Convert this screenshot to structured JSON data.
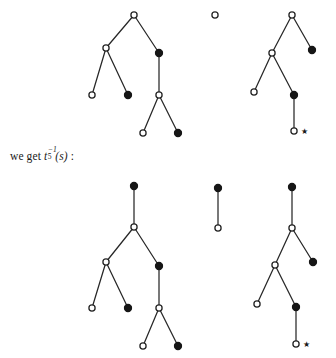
{
  "figure": {
    "caption": {
      "prefix": "we get ",
      "symbol_base": "t",
      "symbol_sub": "5",
      "symbol_sup": "−1",
      "symbol_arg": "(s)",
      "suffix": " :"
    },
    "legend": {
      "open_node": "open-circle-vertex",
      "filled_node": "filled-circle-vertex",
      "star": "★"
    },
    "colors": {
      "ink": "#1a1a1a",
      "edge": "#272727",
      "node_fill_open": "#ffffff",
      "node_fill_closed": "#161616",
      "background": "#ffffff"
    },
    "geometry": {
      "node_radius_open": 3.1,
      "node_radius_filled": 3.6,
      "star_glyph": "★"
    },
    "rows": [
      {
        "name": "top-row",
        "trees": [
          {
            "name": "top-left-tree",
            "nodes": [
              {
                "id": "tl-n1",
                "type": "open",
                "x": 134,
                "y": 15
              },
              {
                "id": "tl-n2",
                "type": "open",
                "x": 106,
                "y": 48
              },
              {
                "id": "tl-n3",
                "type": "filled",
                "x": 159,
                "y": 53
              },
              {
                "id": "tl-n4",
                "type": "open",
                "x": 92,
                "y": 95
              },
              {
                "id": "tl-n5",
                "type": "filled",
                "x": 128,
                "y": 95
              },
              {
                "id": "tl-n6",
                "type": "open",
                "x": 159,
                "y": 95
              },
              {
                "id": "tl-n7",
                "type": "open",
                "x": 143,
                "y": 133
              },
              {
                "id": "tl-n8",
                "type": "filled",
                "x": 178,
                "y": 133
              }
            ],
            "edges": [
              [
                "tl-n1",
                "tl-n2"
              ],
              [
                "tl-n1",
                "tl-n3"
              ],
              [
                "tl-n2",
                "tl-n4"
              ],
              [
                "tl-n2",
                "tl-n5"
              ],
              [
                "tl-n3",
                "tl-n6"
              ],
              [
                "tl-n6",
                "tl-n7"
              ],
              [
                "tl-n6",
                "tl-n8"
              ]
            ],
            "marks": []
          },
          {
            "name": "top-middle-single-node",
            "nodes": [
              {
                "id": "tm-n1",
                "type": "open",
                "x": 215,
                "y": 15
              }
            ],
            "edges": [],
            "marks": []
          },
          {
            "name": "top-right-tree",
            "nodes": [
              {
                "id": "tr-n1",
                "type": "open",
                "x": 292,
                "y": 15
              },
              {
                "id": "tr-n2",
                "type": "open",
                "x": 272,
                "y": 53
              },
              {
                "id": "tr-n3",
                "type": "filled",
                "x": 312,
                "y": 50
              },
              {
                "id": "tr-n4",
                "type": "open",
                "x": 254,
                "y": 92
              },
              {
                "id": "tr-n5",
                "type": "filled",
                "x": 294,
                "y": 95
              },
              {
                "id": "tr-n6",
                "type": "open",
                "x": 294,
                "y": 131
              }
            ],
            "edges": [
              [
                "tr-n1",
                "tr-n2"
              ],
              [
                "tr-n1",
                "tr-n3"
              ],
              [
                "tr-n2",
                "tr-n4"
              ],
              [
                "tr-n2",
                "tr-n5"
              ],
              [
                "tr-n5",
                "tr-n6"
              ]
            ],
            "marks": [
              {
                "id": "tr-star",
                "glyph": "★",
                "x": 301,
                "y": 131
              }
            ]
          }
        ]
      },
      {
        "name": "bottom-row",
        "trees": [
          {
            "name": "bottom-left-tree",
            "nodes": [
              {
                "id": "bl-n0",
                "type": "filled",
                "x": 134,
                "y": 186
              },
              {
                "id": "bl-n1",
                "type": "open",
                "x": 134,
                "y": 227
              },
              {
                "id": "bl-n2",
                "type": "open",
                "x": 106,
                "y": 262
              },
              {
                "id": "bl-n3",
                "type": "filled",
                "x": 159,
                "y": 266
              },
              {
                "id": "bl-n4",
                "type": "open",
                "x": 92,
                "y": 308
              },
              {
                "id": "bl-n5",
                "type": "filled",
                "x": 128,
                "y": 308
              },
              {
                "id": "bl-n6",
                "type": "open",
                "x": 159,
                "y": 308
              },
              {
                "id": "bl-n7",
                "type": "open",
                "x": 143,
                "y": 346
              },
              {
                "id": "bl-n8",
                "type": "filled",
                "x": 178,
                "y": 346
              }
            ],
            "edges": [
              [
                "bl-n0",
                "bl-n1"
              ],
              [
                "bl-n1",
                "bl-n2"
              ],
              [
                "bl-n1",
                "bl-n3"
              ],
              [
                "bl-n2",
                "bl-n4"
              ],
              [
                "bl-n2",
                "bl-n5"
              ],
              [
                "bl-n3",
                "bl-n6"
              ],
              [
                "bl-n6",
                "bl-n7"
              ],
              [
                "bl-n6",
                "bl-n8"
              ]
            ],
            "marks": []
          },
          {
            "name": "bottom-middle-edge",
            "nodes": [
              {
                "id": "bm-n1",
                "type": "filled",
                "x": 218,
                "y": 188
              },
              {
                "id": "bm-n2",
                "type": "open",
                "x": 218,
                "y": 228
              }
            ],
            "edges": [
              [
                "bm-n1",
                "bm-n2"
              ]
            ],
            "marks": []
          },
          {
            "name": "bottom-right-tree",
            "nodes": [
              {
                "id": "br-n0",
                "type": "filled",
                "x": 292,
                "y": 187
              },
              {
                "id": "br-n1",
                "type": "open",
                "x": 292,
                "y": 228
              },
              {
                "id": "br-n2",
                "type": "open",
                "x": 275,
                "y": 265
              },
              {
                "id": "br-n3",
                "type": "filled",
                "x": 313,
                "y": 262
              },
              {
                "id": "br-n4",
                "type": "open",
                "x": 257,
                "y": 304
              },
              {
                "id": "br-n5",
                "type": "filled",
                "x": 296,
                "y": 307
              },
              {
                "id": "br-n6",
                "type": "open",
                "x": 296,
                "y": 344
              }
            ],
            "edges": [
              [
                "br-n0",
                "br-n1"
              ],
              [
                "br-n1",
                "br-n2"
              ],
              [
                "br-n1",
                "br-n3"
              ],
              [
                "br-n2",
                "br-n4"
              ],
              [
                "br-n2",
                "br-n5"
              ],
              [
                "br-n5",
                "br-n6"
              ]
            ],
            "marks": [
              {
                "id": "br-star",
                "glyph": "★",
                "x": 303,
                "y": 344
              }
            ]
          }
        ]
      }
    ]
  }
}
